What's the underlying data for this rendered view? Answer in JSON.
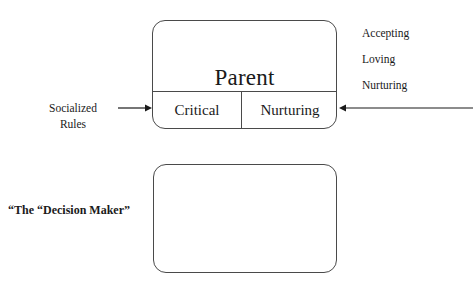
{
  "diagram": {
    "boxes": [
      {
        "id": "parent",
        "title": "Parent",
        "cells": [
          {
            "id": "critical",
            "label": "Critical"
          },
          {
            "id": "nurturing",
            "label": "Nurturing"
          }
        ]
      },
      {
        "id": "adult",
        "title": "Adult",
        "cells": []
      }
    ],
    "annotations": {
      "right_traits": [
        "Accepting",
        "Loving",
        "Nurturing"
      ],
      "left_input_line1": "Socialized",
      "left_input_line2": "Rules",
      "adult_caption": "“The “Decision Maker”"
    },
    "arrows": [
      {
        "id": "arrow-into-critical",
        "direction": "right"
      },
      {
        "id": "arrow-into-nurturing",
        "direction": "left"
      }
    ],
    "colors": {
      "background": "#ffffff",
      "stroke": "#4a4a4a",
      "text": "#1a1a1a"
    }
  }
}
